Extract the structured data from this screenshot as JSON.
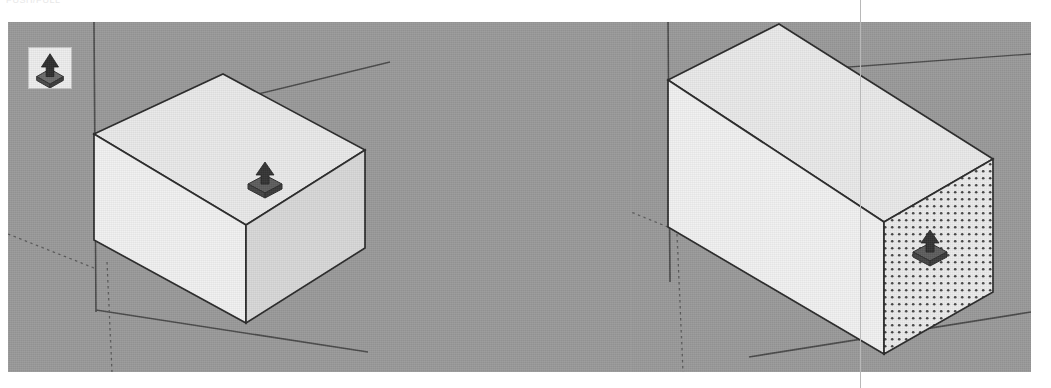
{
  "page": {
    "cut_off_text": "PUSH/PULL",
    "gutter_rule_x": 860
  },
  "toolbar": {
    "push_pull_icon": "push-pull-icon",
    "push_pull_label": "Push/Pull"
  },
  "colors": {
    "viewport_background": "#9a9a9a",
    "face_front": "#f1f1f1",
    "face_top": "#e8e8e8",
    "face_side": "#d6d6d6",
    "edge": "#2a2a2a",
    "axis_solid": "#4a4a4a",
    "axis_dotted": "#5a5a5a",
    "highlight_dot": "#4a4a4a",
    "cursor_body": "#575757",
    "cursor_arrow": "#3a3a3a",
    "page_background": "#ffffff",
    "gutter_rule": "#b8b8b8"
  },
  "viewports": [
    {
      "id": "viewport-before",
      "name": "sketchup-viewport-before",
      "caption": "",
      "geometry": "box",
      "state": "cursor-on-top-face",
      "cursor": {
        "icon": "push-pull-cursor",
        "x": 248,
        "y": 152
      },
      "faces": {
        "top": {
          "highlighted": false,
          "label": "top-face"
        },
        "front": {
          "highlighted": false,
          "label": "front-face"
        },
        "right": {
          "highlighted": false,
          "label": "right-face"
        }
      },
      "axes": {
        "vertical_solid": true,
        "right_solid": true,
        "ground_solid": true,
        "negative_dotted": true
      }
    },
    {
      "id": "viewport-after",
      "name": "sketchup-viewport-after",
      "caption": "",
      "geometry": "box-extruded",
      "state": "end-face-highlighted",
      "cursor": {
        "icon": "push-pull-cursor",
        "x": 897,
        "y": 226
      },
      "faces": {
        "top": {
          "highlighted": false,
          "label": "top-face"
        },
        "front": {
          "highlighted": false,
          "label": "front-face"
        },
        "right": {
          "highlighted": true,
          "label": "right-end-face-selected"
        }
      },
      "axes": {
        "vertical_solid": true,
        "right_solid": true,
        "ground_solid": true,
        "negative_dotted": true
      }
    }
  ]
}
